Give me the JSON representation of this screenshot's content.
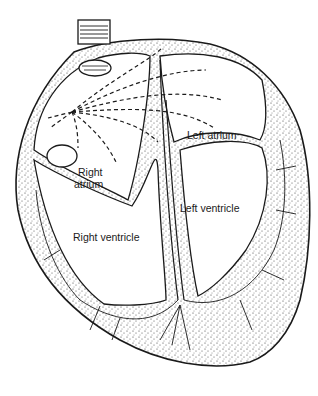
{
  "diagram": {
    "labels": {
      "left_atrium": "Left atrium",
      "right_atrium_line1": "Right",
      "right_atrium_line2": "atrium",
      "left_ventricle": "Left ventricle",
      "right_ventricle": "Right ventricle"
    },
    "structures": [
      "superior-vena-cava",
      "inferior-vena-cava",
      "sinoatrial-node",
      "atrial-conduction-paths",
      "atrial-septum",
      "interventricular-septum",
      "purkinje-fibers",
      "myocardium"
    ],
    "colors": {
      "ink": "#1a1a1a",
      "background": "#ffffff",
      "stipple": "#333333"
    }
  }
}
